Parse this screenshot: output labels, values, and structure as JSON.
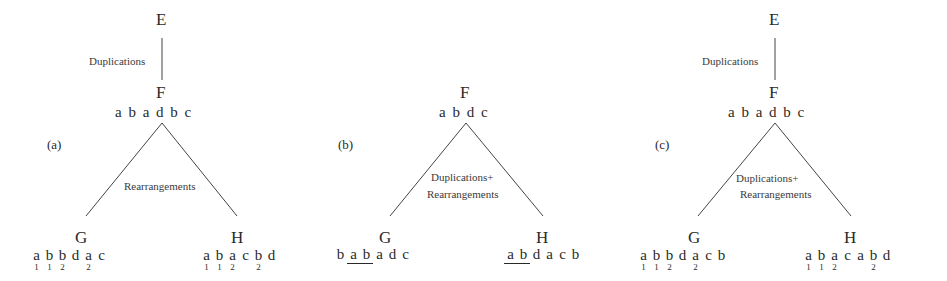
{
  "panels": [
    {
      "id": "a",
      "label": "(a)",
      "root": {
        "name": "E"
      },
      "root_edge_label": "Duplications",
      "ancestor": {
        "name": "F",
        "sequence": [
          "a",
          "b",
          "a",
          "d",
          "b",
          "c"
        ]
      },
      "split_label_lines": [
        "Rearrangements"
      ],
      "left_child": {
        "name": "G",
        "genes": [
          {
            "g": "a",
            "sub": "1"
          },
          {
            "g": "b",
            "sub": "1"
          },
          {
            "g": "b",
            "sub": "2"
          },
          {
            "g": "d",
            "sub": ""
          },
          {
            "g": "a",
            "sub": "2"
          },
          {
            "g": "c",
            "sub": ""
          }
        ]
      },
      "right_child": {
        "name": "H",
        "genes": [
          {
            "g": "a",
            "sub": "1"
          },
          {
            "g": "b",
            "sub": "1"
          },
          {
            "g": "a",
            "sub": "2"
          },
          {
            "g": "c",
            "sub": ""
          },
          {
            "g": "b",
            "sub": "2"
          },
          {
            "g": "d",
            "sub": ""
          }
        ]
      }
    },
    {
      "id": "b",
      "label": "(b)",
      "ancestor": {
        "name": "F",
        "sequence": [
          "a",
          "b",
          "d",
          "c"
        ]
      },
      "split_label_lines": [
        "Duplications+",
        "Rearrangements"
      ],
      "left_child": {
        "name": "G",
        "genes": [
          {
            "g": "b",
            "ul": false
          },
          {
            "g": "a",
            "ul": true
          },
          {
            "g": "b",
            "ul": true
          },
          {
            "g": "a",
            "ul": false
          },
          {
            "g": "d",
            "ul": false
          },
          {
            "g": "c",
            "ul": false
          }
        ]
      },
      "right_child": {
        "name": "H",
        "genes": [
          {
            "g": "a",
            "ul": true
          },
          {
            "g": "b",
            "ul": true
          },
          {
            "g": "d",
            "ul": false
          },
          {
            "g": "a",
            "ul": false
          },
          {
            "g": "c",
            "ul": false
          },
          {
            "g": "b",
            "ul": false
          }
        ]
      }
    },
    {
      "id": "c",
      "label": "(c)",
      "root": {
        "name": "E"
      },
      "root_edge_label": "Duplications",
      "ancestor": {
        "name": "F",
        "sequence": [
          "a",
          "b",
          "a",
          "d",
          "b",
          "c"
        ]
      },
      "split_label_lines": [
        "Duplications+",
        "Rearrangements"
      ],
      "left_child": {
        "name": "G",
        "genes": [
          {
            "g": "a",
            "sub": "1"
          },
          {
            "g": "b",
            "sub": "1"
          },
          {
            "g": "b",
            "sub": "2"
          },
          {
            "g": "d",
            "sub": ""
          },
          {
            "g": "a",
            "sub": "2"
          },
          {
            "g": "c",
            "sub": ""
          },
          {
            "g": "b",
            "sub": ""
          }
        ]
      },
      "right_child": {
        "name": "H",
        "genes": [
          {
            "g": "a",
            "sub": "1"
          },
          {
            "g": "b",
            "sub": "1"
          },
          {
            "g": "a",
            "sub": "2"
          },
          {
            "g": "c",
            "sub": ""
          },
          {
            "g": "a",
            "sub": ""
          },
          {
            "g": "b",
            "sub": "2"
          },
          {
            "g": "d",
            "sub": ""
          }
        ]
      }
    }
  ]
}
